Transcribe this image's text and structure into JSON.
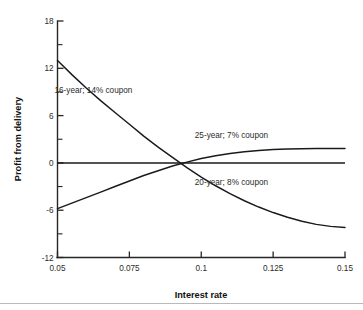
{
  "chart_data": {
    "type": "line",
    "title": "",
    "xlabel": "Interest rate",
    "ylabel": "Profit from delivery",
    "xlim": [
      0.05,
      0.15
    ],
    "ylim": [
      -12,
      18
    ],
    "grid": false,
    "legend_position": "inline-annotations",
    "x_ticks": [
      "0.05",
      "0.075",
      "0.1",
      "0.125",
      "0.15"
    ],
    "x_tick_values": [
      0.05,
      0.075,
      0.1,
      0.125,
      0.15
    ],
    "y_ticks": [
      "18",
      "12",
      "6",
      "0",
      "-6",
      "-12"
    ],
    "y_tick_values": [
      18,
      12,
      6,
      0,
      -6,
      -12
    ],
    "y_minor_values": [
      15,
      9,
      3,
      -3,
      -9
    ],
    "zero_reference_line": 0,
    "crossing_point_x": 0.078,
    "x": [
      0.05,
      0.055,
      0.06,
      0.065,
      0.07,
      0.075,
      0.08,
      0.085,
      0.09,
      0.095,
      0.1,
      0.105,
      0.11,
      0.115,
      0.12,
      0.125,
      0.13,
      0.135,
      0.14,
      0.145,
      0.15
    ],
    "series": [
      {
        "name": "16-year; 14% coupon",
        "label": "16-year; 14% coupon",
        "label_x": 0.0625,
        "label_y": 9.2,
        "values": [
          13.0,
          11.2,
          9.5,
          7.9,
          6.4,
          4.9,
          3.4,
          2.0,
          0.7,
          -0.6,
          -1.8,
          -2.9,
          -3.9,
          -4.8,
          -5.6,
          -6.3,
          -6.9,
          -7.4,
          -7.8,
          -8.05,
          -8.2
        ]
      },
      {
        "name": "25-year; 7% coupon",
        "label": "25-year; 7% coupon",
        "label_x": 0.1105,
        "label_y": 3.6,
        "values": [
          -5.8,
          -5.1,
          -4.4,
          -3.7,
          -3.0,
          -2.3,
          -1.6,
          -1.0,
          -0.4,
          0.1,
          0.55,
          0.9,
          1.2,
          1.42,
          1.58,
          1.7,
          1.76,
          1.8,
          1.82,
          1.83,
          1.83
        ]
      },
      {
        "name": "20-year; 8% coupon",
        "label": "20-year; 8% coupon",
        "label_x": 0.1105,
        "label_y": -2.4,
        "values": [
          0,
          0,
          0,
          0,
          0,
          0,
          0,
          0,
          0,
          0,
          0,
          0,
          0,
          0,
          0,
          0,
          0,
          0,
          0,
          0,
          0
        ]
      }
    ]
  }
}
